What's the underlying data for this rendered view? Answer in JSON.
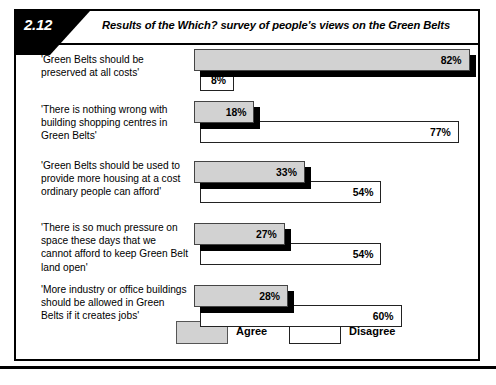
{
  "figure": {
    "number": "2.12",
    "title": "Results of the Which? survey of people's views on the Green Belts"
  },
  "legend": {
    "agree": {
      "label": "Agree",
      "color": "#d2d2d2"
    },
    "disagree": {
      "label": "Disagree",
      "color": "#ffffff"
    }
  },
  "rows": [
    {
      "statement": "'Green Belts should be preserved at all costs'",
      "agree_label": "82%",
      "disagree_label": "8%"
    },
    {
      "statement": "'There is nothing wrong with building shopping centres in Green Belts'",
      "agree_label": "18%",
      "disagree_label": "77%"
    },
    {
      "statement": "'Green Belts should be used to provide more housing at a cost ordinary people can afford'",
      "agree_label": "33%",
      "disagree_label": "54%"
    },
    {
      "statement": "'There is so much pressure on space these days that we cannot afford to keep Green Belt land open'",
      "agree_label": "27%",
      "disagree_label": "54%"
    },
    {
      "statement": "'More industry or office buildings should be allowed in Green Belts if it creates jobs'",
      "agree_label": "28%",
      "disagree_label": "60%"
    }
  ],
  "chart_data": {
    "type": "bar",
    "title": "Results of the Which? survey of people's views on the Green Belts",
    "orientation": "horizontal",
    "xlabel": "",
    "ylabel": "",
    "xlim": [
      0,
      100
    ],
    "unit": "%",
    "grid": false,
    "legend_position": "bottom",
    "categories": [
      "'Green Belts should be preserved at all costs'",
      "'There is nothing wrong with building shopping centres in Green Belts'",
      "'Green Belts should be used to provide more housing at a cost ordinary people can afford'",
      "'There is so much pressure on space these days that we cannot afford to keep Green Belt land open'",
      "'More industry or office buildings should be allowed in Green Belts if it creates jobs'"
    ],
    "series": [
      {
        "name": "Agree",
        "color": "#d2d2d2",
        "values": [
          82,
          18,
          33,
          27,
          28
        ]
      },
      {
        "name": "Disagree",
        "color": "#ffffff",
        "values": [
          8,
          77,
          54,
          54,
          60
        ]
      }
    ]
  },
  "layout": {
    "bar_scale_px_per_pct": 3.36,
    "row_heights": [
      52,
      58,
      62,
      62,
      62
    ],
    "label_tops": [
      8,
      6,
      4,
      4,
      4
    ],
    "agree_tops": [
      4,
      4,
      6,
      6,
      6
    ],
    "disagree_tops": [
      24,
      24,
      26,
      26,
      26
    ]
  }
}
